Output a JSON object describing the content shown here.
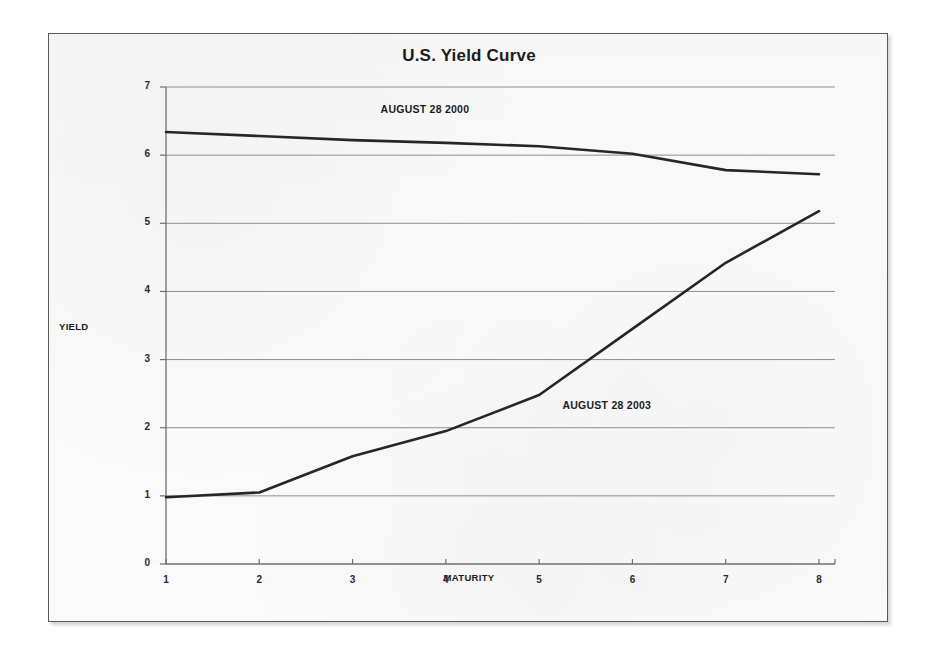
{
  "figure": {
    "title": "U.S. Yield Curve"
  },
  "chart_data": {
    "type": "line",
    "title": "U.S. Yield Curve",
    "xlabel": "MATURITY",
    "ylabel": "YIELD",
    "x": [
      1,
      2,
      3,
      4,
      5,
      6,
      7,
      8
    ],
    "xticklabels": [
      "1",
      "2",
      "3",
      "4",
      "5",
      "6",
      "7",
      "8"
    ],
    "yticklabels": [
      "0",
      "1",
      "2",
      "3",
      "4",
      "5",
      "6",
      "7"
    ],
    "xlim": [
      1,
      8
    ],
    "ylim": [
      0,
      7
    ],
    "grid": "horizontal",
    "legend": "inline-annotations",
    "series": [
      {
        "name": "AUGUST 28 2000",
        "color": "#262626",
        "values": [
          6.34,
          6.28,
          6.22,
          6.18,
          6.13,
          6.02,
          5.78,
          5.72
        ],
        "annotation": {
          "text": "AUGUST 28 2000",
          "x": 3.3,
          "y": 6.66
        }
      },
      {
        "name": "AUGUST 28 2003",
        "color": "#262626",
        "values": [
          0.98,
          1.05,
          1.58,
          1.95,
          2.48,
          3.45,
          4.42,
          5.18
        ],
        "annotation": {
          "text": "AUGUST 28 2003",
          "x": 5.25,
          "y": 2.32
        }
      }
    ]
  }
}
